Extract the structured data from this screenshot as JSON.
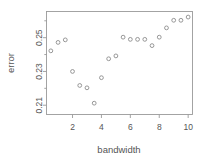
{
  "chart_data": {
    "type": "scatter",
    "title": "",
    "xlabel": "bandwidth",
    "ylabel": "error",
    "xlim": [
      0.2,
      10.3
    ],
    "ylim": [
      0.2045,
      0.2655
    ],
    "grid": false,
    "legend": null,
    "xticks": [
      2,
      4,
      6,
      8,
      10
    ],
    "xtick_labels": [
      "2",
      "4",
      "6",
      "8",
      "10"
    ],
    "yticks": [
      0.21,
      0.23,
      0.25
    ],
    "ytick_labels": [
      "0.21",
      "0.23",
      "0.25"
    ],
    "minor_yticks": [
      0.22,
      0.24,
      0.26
    ],
    "marker": "open-circle",
    "marker_color": "#8c8c8c",
    "x": [
      0.5,
      1.0,
      1.5,
      2.0,
      2.5,
      3.0,
      3.5,
      4.0,
      4.5,
      5.0,
      5.5,
      6.0,
      6.5,
      7.0,
      7.5,
      8.0,
      8.5,
      9.0,
      9.5,
      10.0
    ],
    "y": [
      0.2422,
      0.2472,
      0.2487,
      0.23,
      0.2217,
      0.2203,
      0.2112,
      0.2263,
      0.2375,
      0.2392,
      0.2503,
      0.249,
      0.249,
      0.249,
      0.2453,
      0.2503,
      0.2558,
      0.2603,
      0.2603,
      0.2622
    ],
    "n_points": 20
  },
  "figure": {
    "background": "#ffffff",
    "frame_color": "#9a9a9a",
    "text_color": "#555555"
  }
}
